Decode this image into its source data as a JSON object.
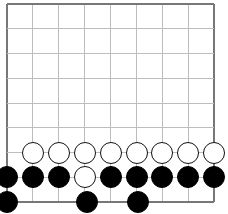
{
  "board": {
    "columns": 9,
    "rows": 9,
    "origin": {
      "x": 7,
      "y": 4
    },
    "spacing": {
      "x": 25.9,
      "y": 24.75
    },
    "edges": {
      "top": true,
      "left": true,
      "right": true,
      "bottom": true
    },
    "colors": {
      "grid": "#bdbdbd",
      "edge": "#777777",
      "black": "#000000",
      "white": "#ffffff"
    }
  },
  "stones": [
    {
      "color": "white",
      "col": 1,
      "row": 6
    },
    {
      "color": "white",
      "col": 2,
      "row": 6
    },
    {
      "color": "white",
      "col": 3,
      "row": 6
    },
    {
      "color": "white",
      "col": 4,
      "row": 6
    },
    {
      "color": "white",
      "col": 5,
      "row": 6
    },
    {
      "color": "white",
      "col": 6,
      "row": 6
    },
    {
      "color": "white",
      "col": 7,
      "row": 6
    },
    {
      "color": "white",
      "col": 8,
      "row": 6
    },
    {
      "color": "black",
      "col": 0,
      "row": 7
    },
    {
      "color": "black",
      "col": 1,
      "row": 7
    },
    {
      "color": "black",
      "col": 2,
      "row": 7
    },
    {
      "color": "white",
      "col": 3,
      "row": 7
    },
    {
      "color": "black",
      "col": 4,
      "row": 7
    },
    {
      "color": "black",
      "col": 5,
      "row": 7
    },
    {
      "color": "black",
      "col": 6,
      "row": 7
    },
    {
      "color": "black",
      "col": 7,
      "row": 7
    },
    {
      "color": "black",
      "col": 8,
      "row": 7
    },
    {
      "color": "black",
      "col": 0,
      "row": 8
    },
    {
      "color": "black",
      "col": 3.1,
      "row": 8
    },
    {
      "color": "black",
      "col": 5.05,
      "row": 8
    }
  ]
}
